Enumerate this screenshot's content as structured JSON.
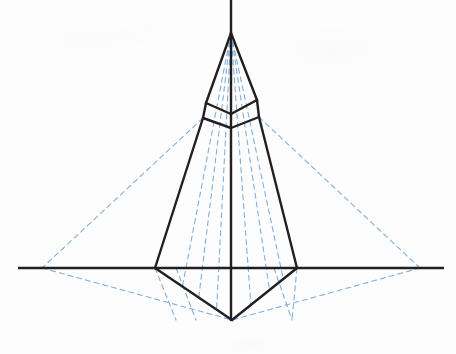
{
  "figure": {
    "background_color": "#fdfdfd",
    "ink_color": "#231f20",
    "construction_color": "#7fb0e0",
    "width": 456,
    "height": 354
  },
  "geometry": {
    "vertical_axis": {
      "x": 231,
      "y_top": 0,
      "y_bottom": 321
    },
    "horizon_line": {
      "y": 268,
      "x_left": 18,
      "x_right": 444
    },
    "left_vanishing_point": {
      "x": 42,
      "y": 268
    },
    "right_vanishing_point": {
      "x": 420,
      "y": 268
    },
    "spire_apex": {
      "x": 231,
      "y": 33
    },
    "spire_left_base": {
      "x": 206,
      "y": 103
    },
    "spire_right_base": {
      "x": 257,
      "y": 100
    },
    "spire_center_dip": {
      "x": 231,
      "y": 114
    },
    "collar_left_lower": {
      "x": 203,
      "y": 118
    },
    "collar_right_lower": {
      "x": 259,
      "y": 117
    },
    "body_left_ground": {
      "x": 155,
      "y": 268
    },
    "body_right_ground": {
      "x": 297,
      "y": 268
    },
    "bottom_vertex": {
      "x": 232,
      "y": 320
    }
  },
  "outline_paths": {
    "spire_left_edge": "M 231,33 L 206,103",
    "spire_right_edge": "M 231,33 L 257,100",
    "spire_left_fold": "M 206,103 L 231,114",
    "spire_right_fold": "M 257,100 L 231,114",
    "collar_left_edge": "M 206,103 L 203,118",
    "collar_right_edge": "M 257,100 L 259,117",
    "collar_left_bottom_fold": "M 203,118 L 231,128",
    "collar_right_bottom_fold": "M 259,117 L 231,128",
    "body_left_edge": "M 203,118 L 155,268",
    "body_right_edge": "M 259,117 L 297,268",
    "body_left_lower": "M 155,268 L 232,320",
    "body_right_lower": "M 297,268 L 232,320"
  },
  "construction_lines": [
    {
      "name": "apex-to-left-vp-upper",
      "d": "M 203,118 L 42,268"
    },
    {
      "name": "apex-to-right-vp-upper",
      "d": "M 259,117 L 420,268"
    },
    {
      "name": "left-vp-to-bottom-vertex",
      "d": "M 42,268 L 232,320"
    },
    {
      "name": "right-vp-to-bottom-vertex",
      "d": "M 420,268 L 232,320"
    },
    {
      "name": "left-vp-to-body-ground",
      "d": "M 42,268 L 155,268"
    },
    {
      "name": "right-vp-to-body-ground",
      "d": "M 420,268 L 297,268"
    },
    {
      "name": "ray-apex-1",
      "d": "M 231,33 L 176,320"
    },
    {
      "name": "ray-apex-2",
      "d": "M 231,33 L 196,320"
    },
    {
      "name": "ray-apex-3",
      "d": "M 231,33 L 216,320"
    },
    {
      "name": "ray-apex-4",
      "d": "M 231,33 L 252,320"
    },
    {
      "name": "ray-apex-5",
      "d": "M 231,33 L 274,320"
    },
    {
      "name": "ray-apex-6",
      "d": "M 231,33 L 292,320"
    },
    {
      "name": "drop-left-outer",
      "d": "M 155,268 L 176,320"
    },
    {
      "name": "drop-left-inner",
      "d": "M 176,268 L 196,320"
    },
    {
      "name": "drop-right-inner",
      "d": "M 274,268 L 292,320"
    },
    {
      "name": "drop-right-outer",
      "d": "M 297,268 L 292,320"
    }
  ],
  "labels": {
    "none": ""
  }
}
